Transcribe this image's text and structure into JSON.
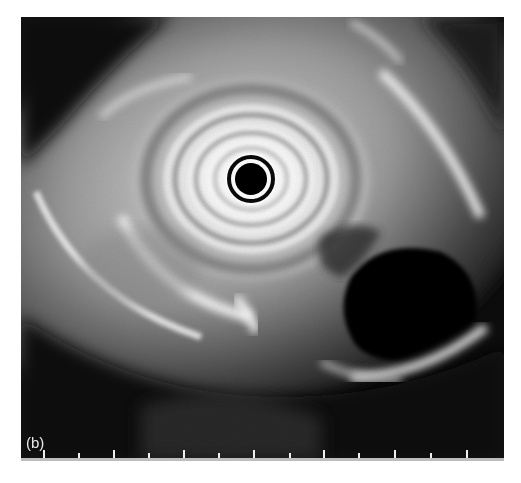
{
  "figure": {
    "panel_label": "(b)",
    "scale": {
      "tick_count": 13,
      "tick_x": [
        43,
        78,
        113,
        148,
        183,
        218,
        253,
        289,
        323,
        358,
        394,
        430,
        466
      ],
      "tick_heights": [
        8,
        5,
        8,
        5,
        8,
        5,
        8,
        5,
        8,
        5,
        8,
        5,
        8
      ]
    },
    "colors": {
      "background": "#0a0a0a",
      "tissue_bright": "#f2f2f2",
      "tissue_mid": "#8a8a8a",
      "lumen_dark": "#050505"
    }
  }
}
